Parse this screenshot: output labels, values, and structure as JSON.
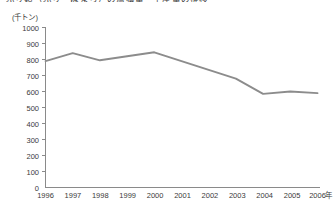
{
  "chart_data": {
    "type": "line",
    "title": "ぶり類（ぶり・はまち）の漁獲量・生産量の推移",
    "unit_label": "(千トン)",
    "xlabel": "年",
    "ylabel": "",
    "categories": [
      "1996",
      "1997",
      "1998",
      "1999",
      "2000",
      "2001",
      "2002",
      "2003",
      "2004",
      "2005",
      "2006"
    ],
    "x_tick_labels": [
      "1996",
      "1997",
      "1998",
      "1999",
      "2000",
      "2001",
      "2002",
      "2003",
      "2004",
      "2005",
      "2006"
    ],
    "y_tick_labels": [
      "0",
      "100",
      "200",
      "300",
      "400",
      "500",
      "600",
      "700",
      "800",
      "900",
      "1000"
    ],
    "y_ticks": [
      0,
      100,
      200,
      300,
      400,
      500,
      600,
      700,
      800,
      900,
      1000
    ],
    "ylim": [
      0,
      1000
    ],
    "grid": false,
    "legend": false,
    "series": [
      {
        "name": "ぶり類",
        "color": "#8c8c8c",
        "values": [
          790,
          840,
          795,
          820,
          845,
          790,
          735,
          680,
          585,
          600,
          590
        ]
      }
    ]
  },
  "axis": {
    "unit": "(千トン)",
    "x_axis_suffix": "年"
  }
}
